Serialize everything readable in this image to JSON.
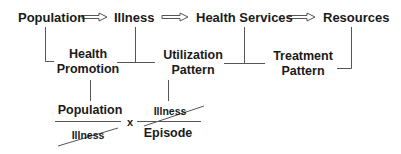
{
  "flow": {
    "nodes": [
      "Population",
      "Illness",
      "Health Services",
      "Resources"
    ],
    "arrow_glyph": "hollow-right-arrow"
  },
  "patterns": {
    "health_promotion": [
      "Health",
      "Promotion"
    ],
    "utilization_pattern": [
      "Utilization",
      "Pattern"
    ],
    "treatment_pattern": [
      "Treatment",
      "Pattern"
    ]
  },
  "formula": {
    "fraction1": {
      "numerator": "Population",
      "denominator": "Illness",
      "denominator_struck": true
    },
    "operator": "x",
    "fraction2": {
      "numerator": "Illness",
      "numerator_struck": true,
      "denominator": "Episode"
    }
  },
  "colors": {
    "text": "#1a1a1a",
    "line": "#555555"
  }
}
